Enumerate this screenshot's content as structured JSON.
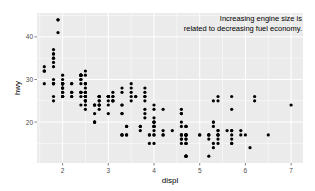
{
  "chart_data": {
    "type": "scatter",
    "title": "",
    "xlabel": "displ",
    "ylabel": "hwy",
    "xlim": [
      1.44,
      7.26
    ],
    "ylim": [
      10.4,
      45.6
    ],
    "x_ticks": [
      2,
      3,
      4,
      5,
      6,
      7
    ],
    "y_ticks": [
      20,
      30,
      40
    ],
    "grid": true,
    "annotation": {
      "lines": [
        "Increasing engine size is",
        "related to decreasing fuel economy."
      ],
      "position": "top-right"
    },
    "points": [
      [
        1.8,
        29
      ],
      [
        1.8,
        29
      ],
      [
        2.0,
        31
      ],
      [
        2.0,
        30
      ],
      [
        2.8,
        26
      ],
      [
        2.8,
        26
      ],
      [
        3.1,
        27
      ],
      [
        1.8,
        26
      ],
      [
        1.8,
        25
      ],
      [
        2.0,
        28
      ],
      [
        2.0,
        27
      ],
      [
        2.8,
        25
      ],
      [
        2.8,
        25
      ],
      [
        3.1,
        25
      ],
      [
        3.1,
        25
      ],
      [
        2.8,
        24
      ],
      [
        3.1,
        25
      ],
      [
        4.2,
        23
      ],
      [
        5.3,
        20
      ],
      [
        5.3,
        15
      ],
      [
        5.3,
        20
      ],
      [
        5.7,
        17
      ],
      [
        6.0,
        17
      ],
      [
        5.7,
        26
      ],
      [
        5.7,
        23
      ],
      [
        6.2,
        26
      ],
      [
        6.2,
        25
      ],
      [
        7.0,
        24
      ],
      [
        5.3,
        19
      ],
      [
        5.3,
        14
      ],
      [
        5.7,
        15
      ],
      [
        6.5,
        17
      ],
      [
        2.4,
        27
      ],
      [
        2.4,
        30
      ],
      [
        3.1,
        26
      ],
      [
        3.5,
        29
      ],
      [
        3.6,
        26
      ],
      [
        2.4,
        24
      ],
      [
        3.0,
        24
      ],
      [
        3.3,
        22
      ],
      [
        3.3,
        22
      ],
      [
        3.3,
        24
      ],
      [
        3.3,
        24
      ],
      [
        3.3,
        17
      ],
      [
        3.8,
        22
      ],
      [
        3.8,
        21
      ],
      [
        3.8,
        23
      ],
      [
        4.0,
        23
      ],
      [
        3.7,
        19
      ],
      [
        3.7,
        18
      ],
      [
        3.9,
        17
      ],
      [
        3.9,
        17
      ],
      [
        4.7,
        19
      ],
      [
        4.7,
        19
      ],
      [
        5.2,
        12
      ],
      [
        5.2,
        17
      ],
      [
        3.9,
        15
      ],
      [
        4.7,
        17
      ],
      [
        4.7,
        17
      ],
      [
        4.7,
        12
      ],
      [
        5.2,
        17
      ],
      [
        5.7,
        16
      ],
      [
        5.9,
        18
      ],
      [
        4.7,
        15
      ],
      [
        4.7,
        16
      ],
      [
        4.7,
        12
      ],
      [
        4.7,
        17
      ],
      [
        4.7,
        17
      ],
      [
        4.7,
        16
      ],
      [
        4.7,
        12
      ],
      [
        4.7,
        15
      ],
      [
        5.2,
        16
      ],
      [
        5.2,
        17
      ],
      [
        5.7,
        15
      ],
      [
        5.9,
        17
      ],
      [
        4.6,
        17
      ],
      [
        5.4,
        18
      ],
      [
        5.4,
        17
      ],
      [
        4.0,
        19
      ],
      [
        4.0,
        19
      ],
      [
        4.0,
        19
      ],
      [
        4.0,
        17
      ],
      [
        4.6,
        17
      ],
      [
        5.0,
        17
      ],
      [
        4.2,
        17
      ],
      [
        4.2,
        17
      ],
      [
        4.6,
        16
      ],
      [
        4.6,
        16
      ],
      [
        4.6,
        17
      ],
      [
        5.4,
        15
      ],
      [
        5.4,
        17
      ],
      [
        5.4,
        26
      ],
      [
        3.8,
        25
      ],
      [
        3.8,
        26
      ],
      [
        4.0,
        24
      ],
      [
        4.0,
        21
      ],
      [
        4.6,
        22
      ],
      [
        4.6,
        23
      ],
      [
        4.6,
        22
      ],
      [
        4.6,
        20
      ],
      [
        5.4,
        25
      ],
      [
        1.6,
        33
      ],
      [
        1.6,
        32
      ],
      [
        1.6,
        32
      ],
      [
        1.6,
        29
      ],
      [
        1.6,
        32
      ],
      [
        1.8,
        34
      ],
      [
        1.8,
        36
      ],
      [
        1.8,
        36
      ],
      [
        2.0,
        29
      ],
      [
        2.4,
        26
      ],
      [
        2.4,
        27
      ],
      [
        2.4,
        30
      ],
      [
        2.4,
        31
      ],
      [
        2.5,
        26
      ],
      [
        2.5,
        26
      ],
      [
        3.3,
        28
      ],
      [
        2.0,
        26
      ],
      [
        2.0,
        29
      ],
      [
        2.0,
        28
      ],
      [
        2.0,
        27
      ],
      [
        2.7,
        24
      ],
      [
        2.7,
        24
      ],
      [
        2.7,
        24
      ],
      [
        3.0,
        22
      ],
      [
        3.7,
        19
      ],
      [
        4.0,
        20
      ],
      [
        4.7,
        17
      ],
      [
        4.7,
        12
      ],
      [
        4.7,
        19
      ],
      [
        5.7,
        18
      ],
      [
        6.1,
        14
      ],
      [
        4.0,
        15
      ],
      [
        4.2,
        18
      ],
      [
        4.4,
        18
      ],
      [
        4.6,
        15
      ],
      [
        5.4,
        17
      ],
      [
        5.4,
        16
      ],
      [
        5.4,
        18
      ],
      [
        4.0,
        17
      ],
      [
        4.0,
        19
      ],
      [
        4.6,
        19
      ],
      [
        5.0,
        17
      ],
      [
        2.4,
        29
      ],
      [
        2.4,
        27
      ],
      [
        2.5,
        31
      ],
      [
        2.5,
        32
      ],
      [
        3.5,
        27
      ],
      [
        3.5,
        26
      ],
      [
        3.0,
        26
      ],
      [
        3.0,
        25
      ],
      [
        3.5,
        25
      ],
      [
        3.3,
        17
      ],
      [
        3.3,
        17
      ],
      [
        4.0,
        20
      ],
      [
        5.6,
        18
      ],
      [
        3.1,
        26
      ],
      [
        3.8,
        26
      ],
      [
        3.8,
        27
      ],
      [
        3.8,
        28
      ],
      [
        5.3,
        25
      ],
      [
        2.5,
        25
      ],
      [
        2.5,
        24
      ],
      [
        2.5,
        27
      ],
      [
        2.5,
        25
      ],
      [
        2.5,
        26
      ],
      [
        2.5,
        23
      ],
      [
        2.2,
        26
      ],
      [
        2.2,
        26
      ],
      [
        2.5,
        26
      ],
      [
        2.5,
        26
      ],
      [
        2.5,
        25
      ],
      [
        2.5,
        27
      ],
      [
        2.5,
        25
      ],
      [
        2.5,
        27
      ],
      [
        2.7,
        20
      ],
      [
        2.7,
        20
      ],
      [
        3.4,
        19
      ],
      [
        3.4,
        17
      ],
      [
        4.0,
        20
      ],
      [
        4.7,
        17
      ],
      [
        2.2,
        29
      ],
      [
        2.2,
        27
      ],
      [
        2.4,
        31
      ],
      [
        2.4,
        31
      ],
      [
        3.0,
        26
      ],
      [
        3.0,
        26
      ],
      [
        3.5,
        28
      ],
      [
        2.2,
        27
      ],
      [
        2.2,
        29
      ],
      [
        2.4,
        31
      ],
      [
        2.4,
        31
      ],
      [
        3.0,
        26
      ],
      [
        3.0,
        26
      ],
      [
        3.3,
        27
      ],
      [
        1.8,
        30
      ],
      [
        1.8,
        33
      ],
      [
        1.8,
        35
      ],
      [
        1.8,
        37
      ],
      [
        1.8,
        35
      ],
      [
        4.7,
        15
      ],
      [
        5.7,
        18
      ],
      [
        2.7,
        20
      ],
      [
        2.7,
        20
      ],
      [
        2.7,
        22
      ],
      [
        3.4,
        17
      ],
      [
        3.4,
        19
      ],
      [
        4.0,
        18
      ],
      [
        4.0,
        20
      ],
      [
        2.0,
        29
      ],
      [
        2.0,
        26
      ],
      [
        2.0,
        29
      ],
      [
        2.0,
        29
      ],
      [
        2.8,
        24
      ],
      [
        1.9,
        44
      ],
      [
        2.0,
        29
      ],
      [
        2.0,
        26
      ],
      [
        2.0,
        29
      ],
      [
        2.0,
        29
      ],
      [
        2.5,
        29
      ],
      [
        2.5,
        29
      ],
      [
        2.8,
        23
      ],
      [
        2.8,
        24
      ],
      [
        1.9,
        44
      ],
      [
        1.9,
        41
      ],
      [
        2.0,
        29
      ],
      [
        2.0,
        26
      ],
      [
        2.5,
        28
      ],
      [
        2.5,
        29
      ],
      [
        1.8,
        29
      ],
      [
        1.8,
        29
      ],
      [
        2.0,
        28
      ],
      [
        2.0,
        29
      ],
      [
        2.8,
        26
      ],
      [
        2.8,
        26
      ],
      [
        3.6,
        26
      ]
    ]
  }
}
